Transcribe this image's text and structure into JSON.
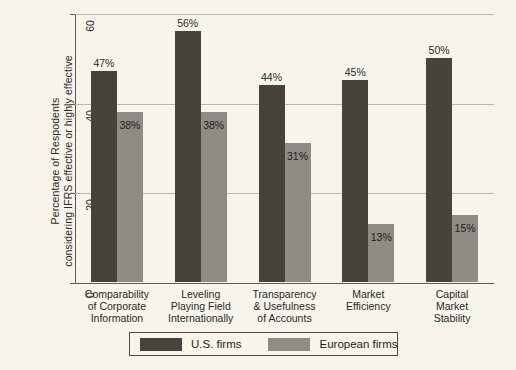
{
  "chart_data": {
    "type": "bar",
    "title": "",
    "xlabel": "",
    "ylabel": "Percentage of Respodents\nconsidering IFRS effective or highly effective",
    "ylim": [
      0,
      60
    ],
    "yticks": [
      0,
      20,
      40,
      60
    ],
    "ytick_labels": [
      "0",
      "20",
      "40",
      "60"
    ],
    "grid": true,
    "legend_position": "bottom",
    "categories": [
      "Comparability\nof Corporate\nInformation",
      "Leveling\nPlaying Field\nInternationally",
      "Transparency\n& Usefulness\nof Accounts",
      "Market\nEfficiency",
      "Capital\nMarket\nStability"
    ],
    "series": [
      {
        "name": "U.S. firms",
        "color": "#46433c",
        "values": [
          47,
          56,
          44,
          45,
          50
        ],
        "data_labels": [
          "47%",
          "56%",
          "44%",
          "45%",
          "50%"
        ]
      },
      {
        "name": "European firms",
        "color": "#8e8c85",
        "values": [
          38,
          38,
          31,
          13,
          15
        ],
        "data_labels": [
          "38%",
          "38%",
          "31%",
          "13%",
          "15%"
        ]
      }
    ]
  },
  "legend": {
    "items": [
      {
        "label": "U.S. firms",
        "color": "#46433c"
      },
      {
        "label": "European firms",
        "color": "#8e8c85"
      }
    ]
  },
  "colors": {
    "background": "#f7f4ec",
    "axis": "#5c5a52",
    "gridline": "#b9b6ac",
    "us_firms": "#46433c",
    "european_firms": "#8e8c85"
  }
}
